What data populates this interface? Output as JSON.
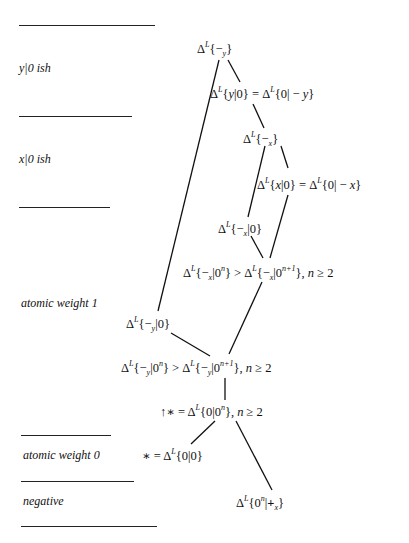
{
  "diagram": {
    "type": "hasse-diagram",
    "regions": [
      {
        "id": "y-ish",
        "label": "y|0 ish"
      },
      {
        "id": "x-ish",
        "label": "x|0 ish"
      },
      {
        "id": "aw1",
        "label": "atomic weight 1"
      },
      {
        "id": "aw0",
        "label": "atomic weight 0"
      },
      {
        "id": "neg",
        "label": "negative"
      }
    ],
    "nodes": [
      {
        "id": "n1",
        "pre": "",
        "sub": "y",
        "core": "−",
        "body_open": "{",
        "body": "",
        "body_close": "}",
        "suffix": ""
      },
      {
        "id": "n2",
        "text": "ΔL{y|0} = ΔL{0| − y}"
      },
      {
        "id": "n3",
        "text": "ΔL{−x}"
      },
      {
        "id": "n4",
        "text": "ΔL{x|0} = ΔL{0| − x}"
      },
      {
        "id": "n5",
        "text": "ΔL{−x|0}"
      },
      {
        "id": "n6",
        "text": "ΔL{−x|0^n} > ΔL{−x|0^(n+1)}, n ≥ 2"
      },
      {
        "id": "n7",
        "text": "ΔL{−y|0}"
      },
      {
        "id": "n8",
        "text": "ΔL{−y|0^n} > ΔL{−y|0^(n+1)}, n ≥ 2"
      },
      {
        "id": "n9",
        "text": "↑∗ = ΔL{0|0^n}, n ≥ 2"
      },
      {
        "id": "n10",
        "text": "∗ = ΔL{0|0}"
      },
      {
        "id": "n11",
        "text": "ΔL{0^n|+x}"
      }
    ],
    "edges": [
      [
        "n1",
        "n2"
      ],
      [
        "n1",
        "n7"
      ],
      [
        "n2",
        "n3"
      ],
      [
        "n3",
        "n4"
      ],
      [
        "n3",
        "n5"
      ],
      [
        "n4",
        "n6"
      ],
      [
        "n5",
        "n6"
      ],
      [
        "n6",
        "n8"
      ],
      [
        "n7",
        "n8"
      ],
      [
        "n8",
        "n9"
      ],
      [
        "n9",
        "n10"
      ],
      [
        "n9",
        "n11"
      ]
    ],
    "symbols": {
      "delta": "Δ",
      "L": "L",
      "lbrace": "{",
      "rbrace": "}",
      "bar": "|",
      "zero": "0",
      "arrow_minus": "−",
      "plus": "+",
      "gt": ">",
      "ge": "≥",
      "eq": "=",
      "star": "∗",
      "up": "↑",
      "comma_n": ", ",
      "n": "n",
      "two": "2",
      "n_plus_1": "n+1",
      "x": "x",
      "y": "y",
      "minus_sp": " − "
    }
  }
}
